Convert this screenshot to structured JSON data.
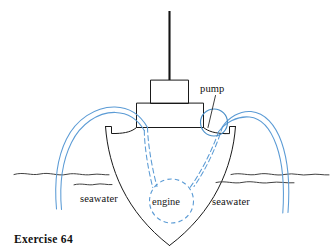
{
  "figure": {
    "caption": "Exercise 64",
    "title": "Exercise 64",
    "domain_note": "Cross-section diagram of a boat hull with seawater cooling pipes"
  },
  "labels": {
    "pump": "pump",
    "engine": "engine",
    "seawater_left": "seawater",
    "seawater_right": "seawater"
  },
  "colors": {
    "ink": "#1a1a1a",
    "pipe_blue": "#5b9bd5",
    "pump_blue": "#4a8fc8",
    "background": "#ffffff"
  },
  "parts": {
    "mast": "mast",
    "upper_cabin": "upper-cabin",
    "lower_cabin": "lower-cabin",
    "deck": "deck",
    "hull": "hull",
    "gunwale_left": "gunwale-left",
    "gunwale_right": "gunwale-right",
    "waterline_left": "waterline-left",
    "waterline_right": "waterline-right",
    "intake_pipe": "seawater-intake-pipe",
    "outlet_pipe": "seawater-outlet-pipe",
    "engine_feed_left": "engine-feed-pipe-left",
    "engine_feed_right": "engine-feed-pipe-right"
  }
}
